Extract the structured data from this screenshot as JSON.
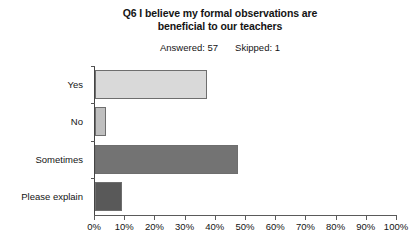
{
  "chart_data": {
    "type": "bar",
    "orientation": "horizontal",
    "title": "Q6 I believe my formal observations are beneficial to our teachers",
    "title_line1": "Q6 I believe my formal observations are",
    "title_line2": "beneficial to our teachers",
    "subtitle": {
      "answered_label": "Answered: 57",
      "skipped_label": "Skipped: 1",
      "answered": 57,
      "skipped": 1
    },
    "categories": [
      "Yes",
      "No",
      "Sometimes",
      "Please explain"
    ],
    "values": [
      37.0,
      3.5,
      47.5,
      8.8
    ],
    "bar_colors": [
      "#d9d9d9",
      "#bfbfbf",
      "#737373",
      "#595959"
    ],
    "xlabel": "",
    "ylabel": "",
    "xlim": [
      0,
      100
    ],
    "xtick_labels": [
      "0%",
      "10%",
      "20%",
      "30%",
      "40%",
      "50%",
      "60%",
      "70%",
      "80%",
      "90%",
      "100%"
    ],
    "xtick_values": [
      0,
      10,
      20,
      30,
      40,
      50,
      60,
      70,
      80,
      90,
      100
    ],
    "grid": false,
    "legend": false
  }
}
